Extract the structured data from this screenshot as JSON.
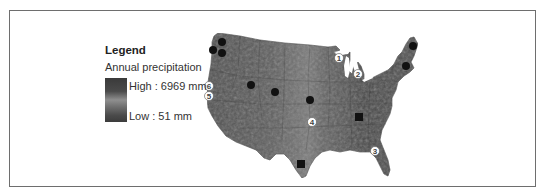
{
  "legend": {
    "title": "Legend",
    "subtitle": "Annual precipitation",
    "high_label": "High : 6969 mm",
    "low_label": "Low : 51 mm",
    "gradient_colors": [
      "#3a3a3a",
      "#8f8f8f",
      "#3c3c3c"
    ]
  },
  "map": {
    "region": "Contiguous United States",
    "fill_color": "#5a5a5a",
    "circle_markers": [
      {
        "x": 222,
        "y": 42
      },
      {
        "x": 213,
        "y": 50
      },
      {
        "x": 222,
        "y": 53
      },
      {
        "x": 251,
        "y": 85
      },
      {
        "x": 275,
        "y": 92
      },
      {
        "x": 310,
        "y": 100
      },
      {
        "x": 413,
        "y": 46
      },
      {
        "x": 406,
        "y": 66
      }
    ],
    "square_markers": [
      {
        "x": 359,
        "y": 117
      },
      {
        "x": 301,
        "y": 164
      }
    ],
    "numbered_markers": [
      {
        "label": "1",
        "x": 339,
        "y": 58
      },
      {
        "label": "2",
        "x": 358,
        "y": 74
      },
      {
        "label": "3",
        "x": 375,
        "y": 151
      },
      {
        "label": "4",
        "x": 312,
        "y": 122
      },
      {
        "label": "5",
        "x": 209,
        "y": 96
      },
      {
        "label": "6",
        "x": 209,
        "y": 86
      }
    ]
  }
}
